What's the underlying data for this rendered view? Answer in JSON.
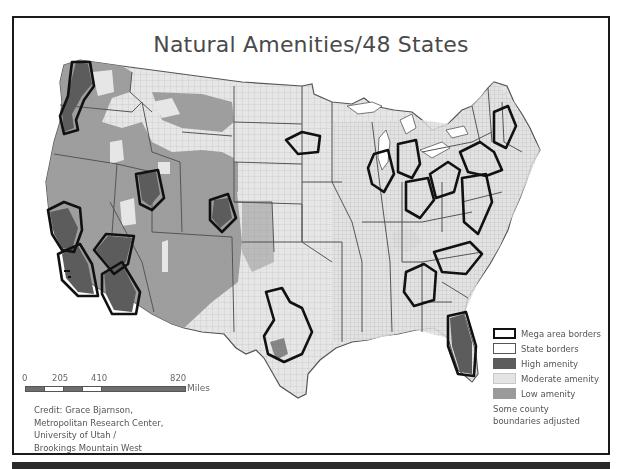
{
  "title": "Natural Amenities/48 States",
  "legend": {
    "items": [
      {
        "key": "mega",
        "label": "Mega area borders",
        "color": "#111111"
      },
      {
        "key": "state",
        "label": "State borders",
        "color": "#555555"
      },
      {
        "key": "high",
        "label": "High amenity",
        "color": "#5c5c5c"
      },
      {
        "key": "moderate",
        "label": "Moderate amenity",
        "color": "#e4e4e4"
      },
      {
        "key": "low",
        "label": "Low amenity",
        "color": "#9a9a9a"
      }
    ],
    "note_line1": "Some county",
    "note_line2": "boundaries adjusted"
  },
  "scale": {
    "ticks": [
      "0",
      "205",
      "410",
      "820"
    ],
    "unit": "Miles"
  },
  "credit": {
    "line1": "Credit: Grace Bjarnson,",
    "line2": "Metropolitan Research Center,",
    "line3": "University of Utah /",
    "line4": "Brookings Mountain West"
  },
  "colors": {
    "frame": "#1a1a1a",
    "high": "#5c5c5c",
    "moderate": "#e4e4e4",
    "low": "#9a9a9a",
    "mega_border": "#111111",
    "state_border": "#555555"
  }
}
